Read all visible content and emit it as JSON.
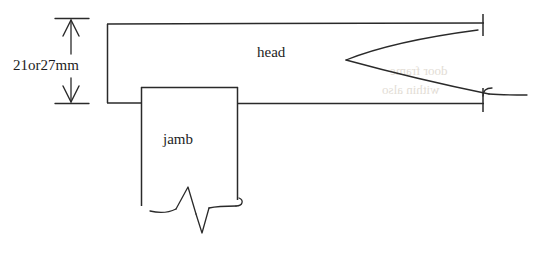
{
  "diagram": {
    "type": "hand-drawn architectural section",
    "background_color": "#ffffff",
    "line_color": "#2a2a2a",
    "labels": {
      "dimension": "21or27mm",
      "head": "head",
      "jamb": "jamb"
    },
    "dimension": {
      "value_text": "21or27mm",
      "orientation": "vertical",
      "measures": "depth from head top face to head underside",
      "top_tick_y": 18,
      "bottom_tick_y": 104,
      "arrow_style": "double-headed"
    },
    "parts": [
      {
        "name": "head",
        "label": "head",
        "description": "horizontal frame member running left to right across the top"
      },
      {
        "name": "jamb",
        "label": "jamb",
        "description": "vertical frame member descending below the head"
      },
      {
        "name": "head-seal",
        "label": "",
        "description": "wedge shaped seal profile drawn at the right end of the head"
      },
      {
        "name": "jamb-seal",
        "label": "",
        "description": "zigzag seal profile drawn at the bottom of the jamb"
      }
    ],
    "ghost_text": [
      "door frame",
      "within also"
    ]
  }
}
